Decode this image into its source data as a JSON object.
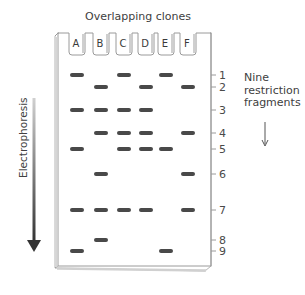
{
  "title": "Overlapping clones",
  "electrophoresis_label": "Electrophoresis",
  "note": {
    "line1": "Nine",
    "line2": "restriction",
    "line3": "fragments"
  },
  "lanes": [
    {
      "label": "A",
      "x": 77,
      "bands": [
        1,
        3,
        5,
        7,
        9
      ]
    },
    {
      "label": "B",
      "x": 101,
      "bands": [
        2,
        3,
        4,
        6,
        7,
        8
      ]
    },
    {
      "label": "C",
      "x": 124,
      "bands": [
        1,
        3,
        4,
        5,
        7
      ]
    },
    {
      "label": "D",
      "x": 146,
      "bands": [
        2,
        3,
        4,
        5,
        7
      ]
    },
    {
      "label": "E",
      "x": 166,
      "bands": [
        1,
        5,
        9
      ]
    },
    {
      "label": "F",
      "x": 188,
      "bands": [
        2,
        4,
        6,
        7
      ]
    }
  ],
  "fragments": [
    {
      "label": "1",
      "y": 75
    },
    {
      "label": "2",
      "y": 87
    },
    {
      "label": "3",
      "y": 110
    },
    {
      "label": "4",
      "y": 133
    },
    {
      "label": "5",
      "y": 149
    },
    {
      "label": "6",
      "y": 174
    },
    {
      "label": "7",
      "y": 210
    },
    {
      "label": "8",
      "y": 240
    },
    {
      "label": "9",
      "y": 251
    }
  ],
  "colors": {
    "band": "#4a4a4a",
    "gel_outline": "#9a9a9a",
    "arrow_dark": "#3a3a3a",
    "arrow_light": "#c8c8c8"
  }
}
